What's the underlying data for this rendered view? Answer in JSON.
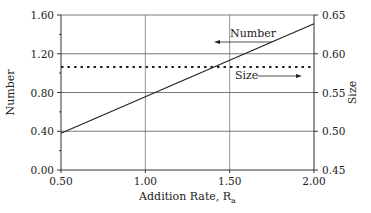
{
  "chart_data": {
    "type": "line",
    "title": "",
    "xlabel": "Addition Rate, R",
    "xlabel_subscript": "a",
    "ylabel": "Number",
    "y2label": "Size",
    "xlim": [
      0.5,
      2.0
    ],
    "ylim": [
      0.0,
      1.6
    ],
    "y2lim": [
      0.45,
      0.65
    ],
    "x_ticks": [
      "0.50",
      "1.00",
      "1.50",
      "2.00"
    ],
    "y_ticks": [
      "0.00",
      "0.40",
      "0.80",
      "1.20",
      "1.60"
    ],
    "y2_ticks": [
      "0.45",
      "0.50",
      "0.55",
      "0.60",
      "0.65"
    ],
    "grid": "horizontal at major y ticks, vertical at x=1.00 and 1.50",
    "legend": "inline annotations with arrows",
    "series": [
      {
        "name": "Number",
        "axis": "left",
        "style": "solid",
        "x": [
          0.5,
          2.0
        ],
        "values": [
          0.38,
          1.51
        ]
      },
      {
        "name": "Size",
        "axis": "right",
        "style": "dotted",
        "x": [
          0.5,
          2.0
        ],
        "values": [
          0.583,
          0.583
        ]
      }
    ],
    "annotations": [
      {
        "text": "Number",
        "arrow": "left"
      },
      {
        "text": "Size",
        "arrow": "right"
      }
    ]
  }
}
